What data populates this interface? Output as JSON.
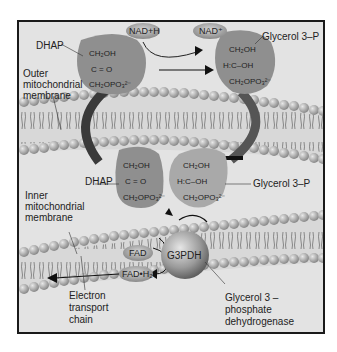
{
  "labels": {
    "dhap_top": "DHAP",
    "nadh": "NAD+H",
    "nad_plus": "NAD⁺",
    "glycerol3p_top": "Glycerol 3–P",
    "outer_membrane": [
      "Outer",
      "mitochondrial",
      "membrane"
    ],
    "dhap_bottom": "DHAP",
    "glycerol3p_bottom": "Glycerol 3–P",
    "inner_membrane": [
      "Inner",
      "mitochondrial",
      "membrane"
    ],
    "fad": "FAD",
    "fadh2": "FAD•H₂",
    "g3pdh": "G3PDH",
    "electron_transport": [
      "Electron",
      "transport",
      "chain"
    ],
    "enzyme_name": [
      "Glycerol 3 –",
      "phosphate",
      "dehydrogenase"
    ]
  },
  "molecules": {
    "dhap": [
      "CH₂OH",
      "C = O",
      "CH₂OPO₃²⁻"
    ],
    "glycerol3p": [
      "CH₂OH",
      "H:C–OH",
      "CH₂OPO₃²⁻"
    ]
  },
  "colors": {
    "background": "#e3e3e3",
    "blob": "#8f8f8f",
    "blob_light": "#a9a9a9",
    "membrane_head": "#b0b0b0",
    "arrow_dark": "#3a3a3a",
    "enzyme": "#9a9a9a"
  }
}
